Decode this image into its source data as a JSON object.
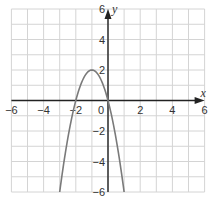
{
  "chart_data": {
    "type": "line",
    "title": "",
    "xlabel": "x",
    "ylabel": "y",
    "xlim": [
      -6,
      6
    ],
    "ylim": [
      -6,
      6
    ],
    "grid": true,
    "grid_step": 1,
    "x_ticks": [
      -6,
      -4,
      -2,
      0,
      2,
      4,
      6
    ],
    "x_tick_labels": [
      "−6",
      "−4",
      "−2",
      "0",
      "2",
      "4",
      "6"
    ],
    "y_ticks": [
      6,
      4,
      2,
      -2,
      -4,
      -6
    ],
    "y_tick_labels": [
      "6",
      "4",
      "2",
      "−2",
      "−4",
      "−6"
    ],
    "series": [
      {
        "name": "y = -2x^2 - 4x",
        "equation": "y = -2x^2 - 4x",
        "vertex": [
          -1,
          2
        ],
        "roots": [
          -2,
          0
        ],
        "x": [
          -3,
          -2.5,
          -2,
          -1.5,
          -1,
          -0.5,
          0,
          0.5,
          1
        ],
        "y": [
          -6,
          -2.5,
          0,
          1.5,
          2,
          1.5,
          0,
          -2.5,
          -6
        ]
      }
    ],
    "colors": {
      "grid": "#d4d4d4",
      "axes": "#222222",
      "curve": "#7a7a7a"
    }
  }
}
